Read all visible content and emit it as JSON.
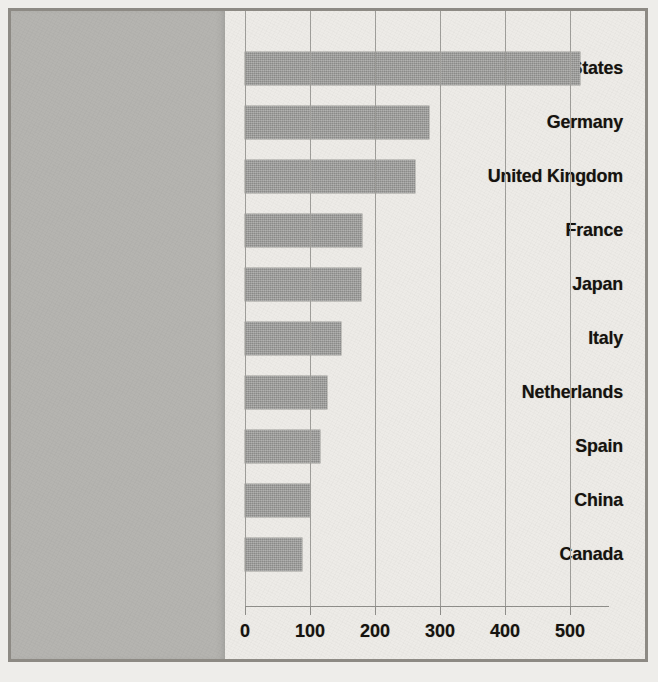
{
  "chart_data": {
    "type": "bar",
    "orientation": "horizontal",
    "title": "",
    "xlabel": "",
    "ylabel": "",
    "categories": [
      "United States",
      "Germany",
      "United Kingdom",
      "France",
      "Japan",
      "Italy",
      "Netherlands",
      "Spain",
      "China",
      "Canada"
    ],
    "values": [
      515,
      283,
      262,
      180,
      179,
      148,
      126,
      115,
      100,
      88
    ],
    "xlim": [
      0,
      560
    ],
    "xticks": [
      0,
      100,
      200,
      300,
      400,
      500
    ],
    "xtick_labels": [
      "0",
      "100",
      "200",
      "300",
      "400",
      "500"
    ],
    "grid": "vertical",
    "legend": "none",
    "series": [
      {
        "name": "",
        "values": [
          515,
          283,
          262,
          180,
          179,
          148,
          126,
          115,
          100,
          88
        ]
      }
    ]
  },
  "colors": {
    "bar_fill": "#9b9b99",
    "label_panel": "#b5b4b0",
    "plot_background": "#edebe7",
    "axis": "#8f8e8a",
    "gridline": "#9f9e9a",
    "text": "#16130f",
    "figure_border": "#8d8a84"
  },
  "background_bleed": [
    "rounding",
    "the growth of",
    "o fill its shape",
    "come of the",
    "which reveals",
    "ernment of the",
    "disrupt recent",
    "process",
    "er over-funding",
    "el of measure",
    "all language",
    "in common",
    "on the for",
    "tive of",
    "tures of leg",
    "urrent"
  ]
}
